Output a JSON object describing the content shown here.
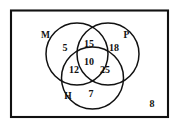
{
  "figure": {
    "stroke_color": "#111111",
    "background_color": "#ffffff",
    "border_color": "#111111"
  },
  "universal_set": {
    "name": "universal-set-rectangle",
    "outside_count": "8"
  },
  "sets": [
    {
      "key": "M",
      "label": "M",
      "name": "set-label-m",
      "cx": 86.5,
      "cy": 52.0,
      "r": 31.5,
      "lx": 45.5,
      "ly": 36.0
    },
    {
      "key": "P",
      "label": "P",
      "name": "set-label-p",
      "cx": 86.5,
      "cy": 52.0,
      "r": 31.5,
      "lx": 126.5,
      "ly": 36.0
    },
    {
      "key": "H",
      "label": "H",
      "name": "set-label-h",
      "cx": 86.5,
      "cy": 52.0,
      "r": 31.5,
      "lx": 68.0,
      "ly": 97.0
    }
  ],
  "regions": [
    {
      "id": "m-only",
      "name": "region-count-m-only",
      "label": "5",
      "x": 65.0,
      "y": 49.0
    },
    {
      "id": "m-and-p",
      "name": "region-count-m-and-p",
      "label": "15",
      "x": 89.0,
      "y": 45.0
    },
    {
      "id": "p-only",
      "name": "region-count-p-only",
      "label": "18",
      "x": 114.0,
      "y": 49.0
    },
    {
      "id": "m-and-h",
      "name": "region-count-m-and-h",
      "label": "12",
      "x": 74.0,
      "y": 71.0
    },
    {
      "id": "m-p-and-h",
      "name": "region-count-m-p-and-h",
      "label": "10",
      "x": 89.0,
      "y": 63.0
    },
    {
      "id": "p-and-h",
      "name": "region-count-p-and-h",
      "label": "25",
      "x": 105.0,
      "y": 71.0
    },
    {
      "id": "h-only",
      "name": "region-count-h-only",
      "label": "7",
      "x": 91.0,
      "y": 95.0
    },
    {
      "id": "outside",
      "name": "region-count-outside",
      "label": "8",
      "x": 152.0,
      "y": 105.0
    }
  ],
  "circle_geometry": {
    "m": {
      "cx": 77.0,
      "cy": 54.0,
      "r": 31.0
    },
    "p": {
      "cx": 108.0,
      "cy": 54.0,
      "r": 31.0
    },
    "h": {
      "cx": 92.5,
      "cy": 78.0,
      "r": 31.0
    }
  },
  "rect_geometry": {
    "x": 11.0,
    "y": 10.5,
    "w": 157.0,
    "h": 106.5
  }
}
